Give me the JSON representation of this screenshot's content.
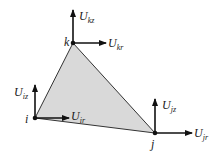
{
  "diagram": {
    "type": "triangular finite element with nodal displacement vectors",
    "colors": {
      "fill": "#d9d9d9",
      "edge": "#333333",
      "arrow": "#111111",
      "text": "#1a1a1a"
    },
    "nodes": [
      {
        "id": "i",
        "label": "i",
        "x": 35,
        "y": 118
      },
      {
        "id": "j",
        "label": "j",
        "x": 155,
        "y": 133
      },
      {
        "id": "k",
        "label": "k",
        "x": 73,
        "y": 43
      }
    ],
    "vectors": {
      "i": {
        "z_base": "U",
        "z_sub": "iz",
        "r_base": "U",
        "r_sub": "ir"
      },
      "j": {
        "z_base": "U",
        "z_sub": "jz",
        "r_base": "U",
        "r_sub": "jr"
      },
      "k": {
        "z_base": "U",
        "z_sub": "kz",
        "r_base": "U",
        "r_sub": "kr"
      }
    }
  }
}
